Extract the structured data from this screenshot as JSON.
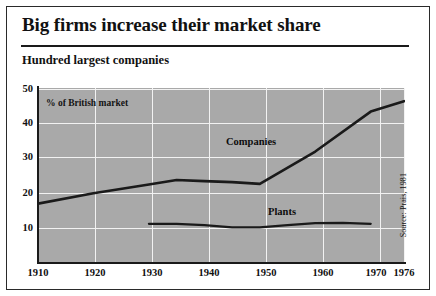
{
  "title": "Big firms increase their market share",
  "subtitle": "Hundred largest companies",
  "axis_note": "% of British market",
  "source": "Source: Prais, 1981",
  "labels": {
    "companies": "Companies",
    "plants": "Plants"
  },
  "chart_data": {
    "type": "line",
    "title": "Big firms increase their market share",
    "subtitle": "Hundred largest companies",
    "xlabel": "",
    "ylabel": "% of British market",
    "xlim": [
      1910,
      1976
    ],
    "ylim": [
      7,
      50
    ],
    "yticks": [
      50,
      40,
      30,
      20,
      10
    ],
    "xticks": [
      1910,
      1920,
      1930,
      1940,
      1950,
      1960,
      1970,
      1976
    ],
    "grid": true,
    "legend": "inline-annotation",
    "plot_bg": "#a9a9a9",
    "grid_color": "#f2f2f2",
    "line_color": "#1a1a1a",
    "series": [
      {
        "name": "Companies",
        "x": [
          1910,
          1920,
          1930,
          1935,
          1940,
          1945,
          1950,
          1960,
          1970,
          1976
        ],
        "values": [
          17,
          20,
          22.5,
          23.8,
          23.5,
          23.2,
          22.7,
          32,
          43.5,
          46.5
        ]
      },
      {
        "name": "Plants",
        "x": [
          1930,
          1935,
          1940,
          1945,
          1950,
          1955,
          1960,
          1965,
          1970
        ],
        "values": [
          11.2,
          11.2,
          10.8,
          10.2,
          10.2,
          10.8,
          11.4,
          11.5,
          11.2
        ]
      }
    ]
  }
}
